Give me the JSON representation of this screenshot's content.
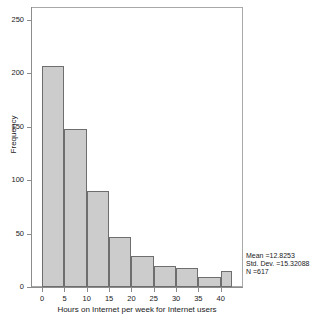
{
  "chart_data": {
    "type": "bar",
    "chart_subtype": "histogram",
    "title": "",
    "xlabel": "Hours on Internet per week for Internet users",
    "ylabel": "Frequency",
    "xlim": [
      -2.5,
      45
    ],
    "ylim": [
      0,
      262
    ],
    "grid": false,
    "legend": null,
    "bin_width": 5,
    "categories": [
      "0-5",
      "5-10",
      "10-15",
      "15-20",
      "20-25",
      "25-30",
      "30-35",
      "35-40",
      "40-45"
    ],
    "bin_starts": [
      0,
      5,
      10,
      15,
      20,
      25,
      30,
      35,
      40
    ],
    "bin_ends": [
      5,
      10,
      15,
      20,
      25,
      30,
      35,
      40,
      42.5
    ],
    "values": [
      207,
      148,
      90,
      47,
      29,
      20,
      18,
      9,
      15
    ],
    "x_ticks": [
      0,
      5,
      10,
      15,
      20,
      25,
      30,
      35,
      40
    ],
    "x_tick_labels": [
      "0",
      "5",
      "10",
      "15",
      "20",
      "25",
      "30",
      "35",
      "40"
    ],
    "y_ticks": [
      0,
      50,
      100,
      150,
      200,
      250
    ],
    "y_tick_labels": [
      "0",
      "50",
      "100",
      "150",
      "200",
      "250"
    ],
    "bar_fill_color": "#cccccc",
    "bar_border_color": "#6e6e6e",
    "frame_color": "#a8a8a8",
    "annotations": [
      "Mean =12.8253",
      "Std. Dev. =15.32088",
      "N =617"
    ],
    "statistics": {
      "mean_label": "Mean =12.8253",
      "mean_value": 12.8253,
      "std_dev_label": "Std. Dev. =15.32088",
      "std_dev_value": 15.32088,
      "n_label": "N =617",
      "n_value": 617
    }
  }
}
